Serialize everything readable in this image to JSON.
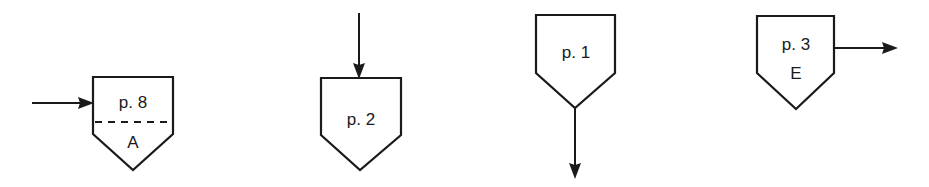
{
  "diagram": {
    "type": "off-page connectors",
    "connectors": [
      {
        "id": "c1",
        "page_label": "p. 8",
        "sub_label": "A",
        "divider": "dashed",
        "arrow": "incoming-left"
      },
      {
        "id": "c2",
        "page_label": "p. 2",
        "sub_label": "",
        "divider": "none",
        "arrow": "incoming-top"
      },
      {
        "id": "c3",
        "page_label": "p. 1",
        "sub_label": "",
        "divider": "none",
        "arrow": "outgoing-bottom"
      },
      {
        "id": "c4",
        "page_label": "p. 3",
        "sub_label": "E",
        "divider": "none",
        "arrow": "outgoing-right"
      }
    ]
  },
  "colors": {
    "stroke": "#1a1a1a",
    "background": "#ffffff"
  }
}
